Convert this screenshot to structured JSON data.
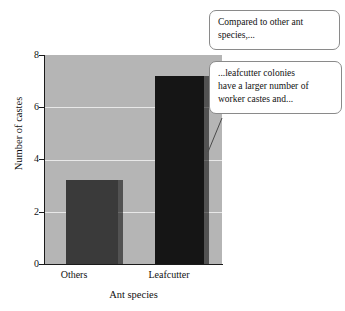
{
  "chart_data": {
    "type": "bar",
    "title": "",
    "subtitle": "",
    "xlabel": "Ant species",
    "ylabel": "Number of castes",
    "categories": [
      "Others",
      "Leafcutter"
    ],
    "values": [
      3.2,
      7.2
    ],
    "series": [
      {
        "name": "Number of castes",
        "values": [
          3.2,
          7.2
        ]
      }
    ],
    "ylim": [
      0,
      8
    ],
    "yticks": [
      0,
      2,
      4,
      6,
      8
    ],
    "ytick_labels": [
      "0",
      "2",
      "4",
      "6",
      "8"
    ],
    "grid": true,
    "grid_axis": "y",
    "legend": false,
    "legend_position": "none",
    "bar_colors": [
      "#3a3a3a",
      "#151515"
    ],
    "plot_background": "#b5b5b5",
    "gridline_color": "#e8e8e8",
    "axis_color": "#1a1a1a",
    "figure_background": "#ffffff"
  },
  "annotations": {
    "callouts": [
      {
        "id": "callout-1",
        "lines": [
          "Compared to other ant",
          "species,..."
        ],
        "text": "Compared to other ant species,..."
      },
      {
        "id": "callout-2",
        "lines": [
          "...leafcutter colonies",
          "have a larger number of",
          "worker castes and..."
        ],
        "text": "...leafcutter colonies have a larger number of worker castes and...",
        "leader_line": true
      }
    ]
  }
}
